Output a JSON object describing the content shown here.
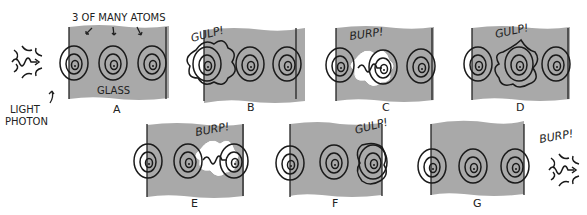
{
  "figure": {
    "annotation_top": "3 OF MANY ATOMS",
    "material_label": "GLASS",
    "light_label_line1": "LIGHT",
    "light_label_line2": "PHOTON",
    "panels": [
      {
        "letter": "A",
        "exclaim": ""
      },
      {
        "letter": "B",
        "exclaim": "GULP!"
      },
      {
        "letter": "C",
        "exclaim": "BURP!"
      },
      {
        "letter": "D",
        "exclaim": "GULP!"
      },
      {
        "letter": "E",
        "exclaim": "BURP!"
      },
      {
        "letter": "F",
        "exclaim": "GULP!"
      },
      {
        "letter": "G",
        "exclaim": "BURP!"
      }
    ],
    "colors": {
      "glass": "#a9a9a9",
      "ink": "#1a1a1a",
      "background": "#ffffff"
    }
  }
}
